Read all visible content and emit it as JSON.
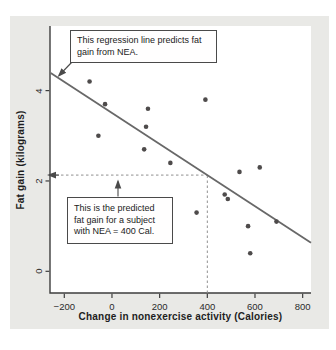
{
  "figure": {
    "page_bg": "#ffffff",
    "panel_color": "#e9e9e6",
    "plot_bg": "#ffffff"
  },
  "chart_data": {
    "type": "scatter",
    "title": "",
    "xlabel": "Change in nonexercise activity (Calories)",
    "ylabel": "Fat gain (kilograms)",
    "xlim": [
      -260,
      835
    ],
    "ylim": [
      -0.48,
      5.43
    ],
    "grid": false,
    "xtick_values": [
      -200,
      0,
      200,
      400,
      600,
      800
    ],
    "xtick_labels": [
      "−200",
      "0",
      "200",
      "400",
      "600",
      "800"
    ],
    "ytick_values": [
      0,
      2,
      4
    ],
    "ytick_labels": [
      "0",
      "2",
      "4"
    ],
    "points": [
      [
        -94,
        4.2
      ],
      [
        -57,
        3.0
      ],
      [
        -29,
        3.7
      ],
      [
        135,
        2.7
      ],
      [
        143,
        3.2
      ],
      [
        151,
        3.6
      ],
      [
        245,
        2.4
      ],
      [
        355,
        1.3
      ],
      [
        392,
        3.8
      ],
      [
        473,
        1.7
      ],
      [
        486,
        1.6
      ],
      [
        535,
        2.2
      ],
      [
        571,
        1.0
      ],
      [
        580,
        0.4
      ],
      [
        620,
        2.3
      ],
      [
        690,
        1.1
      ]
    ],
    "regression_line": {
      "intercept": 3.505,
      "slope": -0.00344,
      "x_start": -257,
      "x_end": 835
    },
    "prediction_guide": {
      "x": 400,
      "predicted_y": 2.13
    },
    "colors": {
      "point": "#4e4b4b",
      "line": "#686868",
      "dash": "#909090",
      "axis": "#3e3e3e",
      "arrow": "#4a4a4a"
    }
  },
  "annotations": {
    "regression_callout": "This regression line predicts fat gain from NEA.",
    "prediction_callout": "This is the predicted fat gain for a subject with NEA = 400 Cal."
  }
}
